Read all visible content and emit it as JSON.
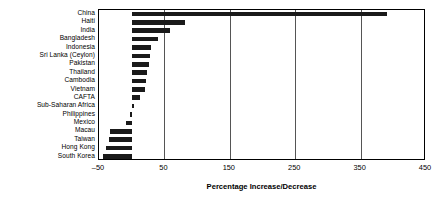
{
  "chart_data": {
    "type": "bar",
    "orientation": "horizontal",
    "title": "",
    "xlabel": "Percentage Increase/Decrease",
    "ylabel": "",
    "xlim": [
      -50,
      450
    ],
    "xticks": [
      -50,
      50,
      150,
      250,
      350,
      450
    ],
    "xtick_labels": [
      "–50",
      "50",
      "150",
      "250",
      "350",
      "450"
    ],
    "grid": true,
    "grid_axis": "x",
    "legend": false,
    "bar_color": "#1a1a1a",
    "categories": [
      "China",
      "Haiti",
      "India",
      "Bangladesh",
      "Indonesia",
      "Sri Lanka (Ceylon)",
      "Pakistan",
      "Thailand",
      "Cambodia",
      "Vietnam",
      "CAFTA",
      "Sub-Saharan Africa",
      "Philippines",
      "Mexico",
      "Macau",
      "Taiwan",
      "Hong Kong",
      "South Korea"
    ],
    "values": [
      390,
      82,
      58,
      40,
      30,
      28,
      26,
      24,
      22,
      20,
      12,
      4,
      -3,
      -8,
      -33,
      -35,
      -40,
      -44
    ]
  }
}
